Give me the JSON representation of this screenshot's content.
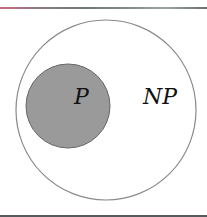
{
  "diagram": {
    "type": "venn-nested-sets",
    "outer_set": {
      "label": "NP",
      "fill": "#ffffff",
      "stroke": "#8a8a8a"
    },
    "inner_set": {
      "label": "P",
      "fill": "#9a9a9a",
      "stroke": "#666666"
    },
    "relation": "P is a subset of NP"
  },
  "colors": {
    "background": "#ffffff",
    "inner_fill": "#9a9a9a",
    "outline": "#8a8a8a"
  }
}
